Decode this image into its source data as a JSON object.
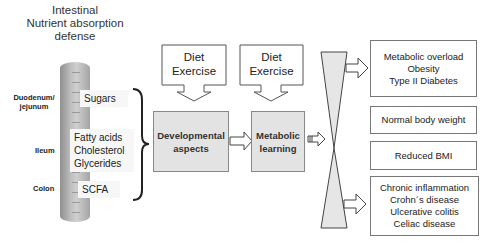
{
  "title": {
    "line1": "Intestinal",
    "line2": "Nutrient absorption",
    "line3": "defense"
  },
  "segments": [
    {
      "label_line1": "Duodenum/",
      "label_line2": "jejunum"
    },
    {
      "label_line1": "Ileum",
      "label_line2": ""
    },
    {
      "label_line1": "Colon",
      "label_line2": ""
    }
  ],
  "nutrients": {
    "duodenum": [
      "Sugars"
    ],
    "ileum": [
      "Fatty acids",
      "Cholesterol",
      "Glycerides"
    ],
    "colon": [
      "SCFA"
    ]
  },
  "callouts": [
    {
      "line1": "Diet",
      "line2": "Exercise"
    },
    {
      "line1": "Diet",
      "line2": "Exercise"
    }
  ],
  "stages": [
    {
      "line1": "Developmental",
      "line2": "aspects"
    },
    {
      "line1": "Metabolic",
      "line2": "learning"
    }
  ],
  "outcomes": [
    {
      "lines": [
        "Metabolic overload",
        "Obesity",
        "Type II Diabetes"
      ]
    },
    {
      "lines": [
        "Normal body weight"
      ]
    },
    {
      "lines": [
        "Reduced BMI"
      ]
    },
    {
      "lines": [
        "Chronic inflammation",
        "Crohn´s disease",
        "Ulcerative colitis",
        "Celiac disease"
      ]
    }
  ],
  "colors": {
    "stage_fill": "#e3e3e3",
    "tube": "#b5b5b5",
    "hourglass": "#e6e6e6",
    "stroke": "#555555"
  }
}
